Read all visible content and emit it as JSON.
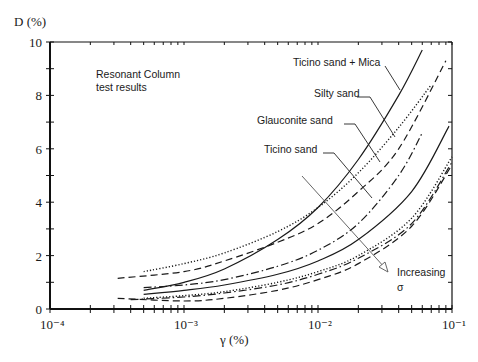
{
  "chart_data": {
    "type": "line",
    "title": "",
    "annotation_title": [
      "Resonant Column",
      "test results"
    ],
    "xlabel": "γ (%)",
    "ylabel": "D (%)",
    "xscale": "log",
    "xlim": [
      0.0001,
      0.1
    ],
    "ylim": [
      0,
      10
    ],
    "x_tick_labels": [
      "10⁻⁴",
      "10⁻³",
      "10⁻²",
      "10⁻¹"
    ],
    "x_tick_values": [
      0.0001,
      0.001,
      0.01,
      0.1
    ],
    "y_tick_labels": [
      "0",
      "2",
      "4",
      "6",
      "8",
      "10"
    ],
    "y_tick_values": [
      0,
      2,
      4,
      6,
      8,
      10
    ],
    "grid": false,
    "legend": "inline labels with leader lines",
    "labels": [
      {
        "text": "Ticino sand + Mica",
        "x": 330,
        "y": 65
      },
      {
        "text": "Silty sand",
        "x": 314,
        "y": 95
      },
      {
        "text": "Glauconite sand",
        "x": 258,
        "y": 123
      },
      {
        "text": "Ticino sand",
        "x": 262,
        "y": 152
      }
    ],
    "arrow_annotation": {
      "text_line1": "Increasing",
      "text_line2": "σ"
    },
    "series": [
      {
        "name": "Ticino sand + Mica (low σ)",
        "style": "solid",
        "x": [
          0.0005,
          0.001,
          0.002,
          0.005,
          0.01,
          0.02,
          0.04,
          0.06
        ],
        "y": [
          0.7,
          1.0,
          1.5,
          2.6,
          3.8,
          5.6,
          8.0,
          9.7
        ]
      },
      {
        "name": "Silty sand (low σ)",
        "style": "dotted",
        "x": [
          0.0005,
          0.001,
          0.002,
          0.005,
          0.01,
          0.02,
          0.04,
          0.07
        ],
        "y": [
          1.4,
          1.7,
          2.1,
          2.9,
          3.8,
          5.1,
          6.8,
          8.4
        ]
      },
      {
        "name": "Glauconite sand (low σ)",
        "style": "dashed",
        "x": [
          0.00032,
          0.001,
          0.002,
          0.005,
          0.01,
          0.02,
          0.04,
          0.09
        ],
        "y": [
          1.15,
          1.4,
          1.8,
          2.5,
          3.2,
          4.4,
          6.0,
          9.3
        ]
      },
      {
        "name": "Ticino sand (low σ)",
        "style": "dashdot",
        "x": [
          0.0005,
          0.001,
          0.002,
          0.005,
          0.01,
          0.02,
          0.04,
          0.06
        ],
        "y": [
          0.8,
          0.9,
          1.1,
          1.6,
          2.2,
          3.2,
          5.0,
          6.6
        ]
      },
      {
        "name": "Ticino sand + Mica (high σ)",
        "style": "solid",
        "x": [
          0.0005,
          0.001,
          0.002,
          0.005,
          0.01,
          0.02,
          0.05,
          0.095
        ],
        "y": [
          0.55,
          0.7,
          0.9,
          1.3,
          1.8,
          2.6,
          4.4,
          6.85
        ]
      },
      {
        "name": "Silty sand (high σ)",
        "style": "dotted",
        "x": [
          0.0005,
          0.001,
          0.002,
          0.005,
          0.01,
          0.02,
          0.05,
          0.1
        ],
        "y": [
          0.4,
          0.5,
          0.65,
          1.0,
          1.4,
          2.0,
          3.4,
          5.7
        ]
      },
      {
        "name": "Glauconite sand (high σ)",
        "style": "dashed",
        "x": [
          0.00032,
          0.001,
          0.002,
          0.005,
          0.01,
          0.02,
          0.05,
          0.1
        ],
        "y": [
          0.4,
          0.3,
          0.4,
          0.7,
          1.1,
          1.7,
          3.1,
          5.4
        ]
      },
      {
        "name": "Ticino sand (high σ)",
        "style": "dashdot",
        "x": [
          0.0004,
          0.001,
          0.002,
          0.005,
          0.01,
          0.02,
          0.05,
          0.1
        ],
        "y": [
          0.35,
          0.45,
          0.6,
          0.9,
          1.3,
          1.9,
          3.2,
          5.5
        ]
      }
    ]
  }
}
